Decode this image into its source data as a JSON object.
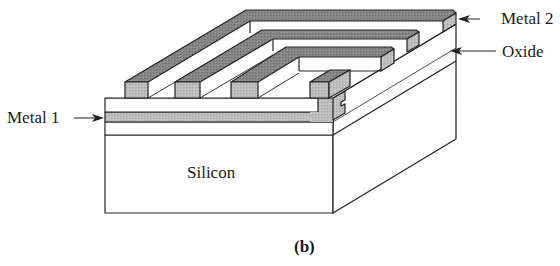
{
  "figure": {
    "caption": "(b)",
    "labels": {
      "metal2": "Metal 2",
      "oxide": "Oxide",
      "metal1": "Metal 1",
      "silicon": "Silicon"
    },
    "colors": {
      "metal_top": "#7a7a7a",
      "metal_front": "#b9b9b9",
      "metal1": "#b4b4b4",
      "oxide": "#ffffff",
      "line": "#222222"
    }
  }
}
